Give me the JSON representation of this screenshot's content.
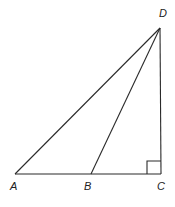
{
  "diagram": {
    "type": "geometry-triangle",
    "colors": {
      "stroke": "#2a2a2a",
      "background": "#ffffff",
      "label": "#222222"
    },
    "points": {
      "A": {
        "label": "A",
        "x": 15,
        "y": 174
      },
      "B": {
        "label": "B",
        "x": 91,
        "y": 174
      },
      "C": {
        "label": "C",
        "x": 161,
        "y": 174
      },
      "D": {
        "label": "D",
        "x": 160,
        "y": 28
      }
    },
    "segments": [
      "AD",
      "BD",
      "CD",
      "AC"
    ],
    "right_angle_at": "C",
    "right_angle_marker_size": 14
  }
}
